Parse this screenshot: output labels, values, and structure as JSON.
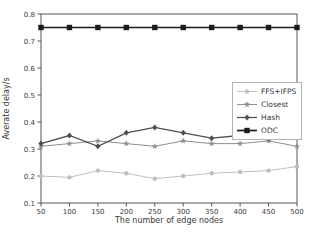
{
  "chart_data": {
    "type": "line",
    "title": "",
    "xlabel": "The number of edge nodes",
    "ylabel": "Averate delay/s",
    "xlim": [
      50,
      500
    ],
    "ylim": [
      0.1,
      0.8
    ],
    "xticks": [
      50,
      100,
      150,
      200,
      250,
      300,
      350,
      400,
      450,
      500
    ],
    "yticks": [
      0.1,
      0.2,
      0.3,
      0.4,
      0.5,
      0.6,
      0.7,
      0.8
    ],
    "grid": false,
    "legend_position": "center-right",
    "x": [
      50,
      100,
      150,
      200,
      250,
      300,
      350,
      400,
      450,
      500
    ],
    "series": [
      {
        "name": "FFS+IFPS",
        "marker": "circle",
        "color": "#bfbfbf",
        "values": [
          0.2,
          0.195,
          0.22,
          0.21,
          0.19,
          0.2,
          0.21,
          0.215,
          0.22,
          0.235
        ]
      },
      {
        "name": "Closest",
        "marker": "star",
        "color": "#8f8f8f",
        "values": [
          0.31,
          0.32,
          0.33,
          0.32,
          0.31,
          0.33,
          0.32,
          0.32,
          0.33,
          0.31
        ]
      },
      {
        "name": "Hash",
        "marker": "diamond",
        "color": "#4f4f4f",
        "values": [
          0.32,
          0.35,
          0.31,
          0.36,
          0.38,
          0.36,
          0.34,
          0.35,
          0.34,
          0.35
        ]
      },
      {
        "name": "ODC",
        "marker": "square",
        "color": "#1c1c1c",
        "values": [
          0.75,
          0.75,
          0.75,
          0.75,
          0.75,
          0.75,
          0.75,
          0.75,
          0.75,
          0.75
        ]
      }
    ]
  }
}
